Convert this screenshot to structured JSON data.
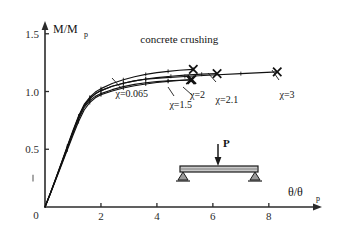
{
  "chart_data": {
    "type": "line",
    "title": "",
    "xlabel": "θ/θp",
    "ylabel": "M/Mp",
    "xlim": [
      0,
      9.4
    ],
    "ylim": [
      0,
      1.55
    ],
    "grid": false,
    "legend_position": "inline-end-of-curve",
    "xticks": [
      0,
      2,
      4,
      6,
      8
    ],
    "xticklabels": [
      "0",
      "2",
      "4",
      "6",
      "8"
    ],
    "yticks": [
      0.5,
      1.0,
      1.5
    ],
    "yticklabels": [
      "0.5",
      "1.0",
      "1.5"
    ],
    "annotations": [
      {
        "text": "concrete crushing",
        "x": 4.8,
        "y": 1.42
      },
      {
        "text": "χ=0.065",
        "x": 3.1,
        "y": 0.95
      },
      {
        "text": "χ=1.5",
        "x": 4.85,
        "y": 0.855
      },
      {
        "text": "χ=2",
        "x": 5.45,
        "y": 0.94
      },
      {
        "text": "χ=2.1",
        "x": 6.5,
        "y": 0.9
      },
      {
        "text": "χ=3",
        "x": 8.65,
        "y": 0.945
      }
    ],
    "series": [
      {
        "name": "χ=0.065",
        "marker": "x-end",
        "points": [
          [
            0.0,
            0.0
          ],
          [
            0.2,
            0.12
          ],
          [
            0.4,
            0.245
          ],
          [
            0.6,
            0.37
          ],
          [
            0.8,
            0.495
          ],
          [
            1.0,
            0.62
          ],
          [
            1.2,
            0.74
          ],
          [
            1.4,
            0.84
          ],
          [
            1.6,
            0.905
          ],
          [
            1.8,
            0.945
          ],
          [
            2.0,
            0.972
          ],
          [
            2.4,
            1.005
          ],
          [
            2.8,
            1.03
          ],
          [
            3.2,
            1.05
          ],
          [
            3.6,
            1.065
          ],
          [
            4.0,
            1.078
          ],
          [
            4.4,
            1.088
          ],
          [
            4.8,
            1.095
          ],
          [
            5.2,
            1.1
          ]
        ]
      },
      {
        "name": "χ=1.5",
        "marker": "x-end",
        "points": [
          [
            0.0,
            0.0
          ],
          [
            0.2,
            0.122
          ],
          [
            0.4,
            0.25
          ],
          [
            0.6,
            0.378
          ],
          [
            0.8,
            0.508
          ],
          [
            1.0,
            0.638
          ],
          [
            1.2,
            0.762
          ],
          [
            1.4,
            0.862
          ],
          [
            1.6,
            0.922
          ],
          [
            1.8,
            0.958
          ],
          [
            2.0,
            0.982
          ],
          [
            2.4,
            1.016
          ],
          [
            2.8,
            1.042
          ],
          [
            3.2,
            1.062
          ],
          [
            3.6,
            1.076
          ],
          [
            4.0,
            1.086
          ],
          [
            4.4,
            1.093
          ],
          [
            4.8,
            1.098
          ],
          [
            5.25,
            1.103
          ]
        ]
      },
      {
        "name": "χ=2",
        "marker": "x-end",
        "points": [
          [
            0.0,
            0.0
          ],
          [
            0.2,
            0.126
          ],
          [
            0.4,
            0.258
          ],
          [
            0.6,
            0.392
          ],
          [
            0.8,
            0.528
          ],
          [
            1.0,
            0.662
          ],
          [
            1.2,
            0.788
          ],
          [
            1.4,
            0.888
          ],
          [
            1.6,
            0.95
          ],
          [
            1.8,
            0.995
          ],
          [
            2.0,
            1.025
          ],
          [
            2.4,
            1.07
          ],
          [
            2.8,
            1.102
          ],
          [
            3.2,
            1.128
          ],
          [
            3.6,
            1.148
          ],
          [
            4.0,
            1.163
          ],
          [
            4.4,
            1.175
          ],
          [
            4.8,
            1.184
          ],
          [
            5.3,
            1.192
          ]
        ]
      },
      {
        "name": "χ=2.1",
        "marker": "x-end",
        "points": [
          [
            0.0,
            0.0
          ],
          [
            0.2,
            0.124
          ],
          [
            0.4,
            0.254
          ],
          [
            0.6,
            0.386
          ],
          [
            0.8,
            0.52
          ],
          [
            1.0,
            0.652
          ],
          [
            1.2,
            0.778
          ],
          [
            1.4,
            0.878
          ],
          [
            1.6,
            0.938
          ],
          [
            1.8,
            0.98
          ],
          [
            2.0,
            1.008
          ],
          [
            2.4,
            1.046
          ],
          [
            2.8,
            1.072
          ],
          [
            3.2,
            1.092
          ],
          [
            3.6,
            1.108
          ],
          [
            4.0,
            1.12
          ],
          [
            4.5,
            1.132
          ],
          [
            5.0,
            1.142
          ],
          [
            5.6,
            1.15
          ],
          [
            6.15,
            1.155
          ]
        ]
      },
      {
        "name": "χ=3",
        "marker": "x-end",
        "points": [
          [
            0.0,
            0.0
          ],
          [
            0.2,
            0.124
          ],
          [
            0.4,
            0.254
          ],
          [
            0.6,
            0.386
          ],
          [
            0.8,
            0.52
          ],
          [
            1.0,
            0.652
          ],
          [
            1.2,
            0.778
          ],
          [
            1.4,
            0.878
          ],
          [
            1.6,
            0.938
          ],
          [
            1.8,
            0.98
          ],
          [
            2.0,
            1.008
          ],
          [
            2.4,
            1.046
          ],
          [
            2.8,
            1.072
          ],
          [
            3.2,
            1.092
          ],
          [
            3.6,
            1.106
          ],
          [
            4.2,
            1.118
          ],
          [
            5.0,
            1.13
          ],
          [
            6.0,
            1.143
          ],
          [
            7.0,
            1.155
          ],
          [
            8.3,
            1.17
          ]
        ]
      }
    ]
  },
  "inset": {
    "name": "simply-supported-beam-diagram",
    "load_label": "P"
  },
  "axis": {
    "y_title_main": "M/M",
    "y_title_sub": "p",
    "x_title_main": "θ/θ",
    "x_title_sub": "p",
    "origin_label": "0"
  }
}
